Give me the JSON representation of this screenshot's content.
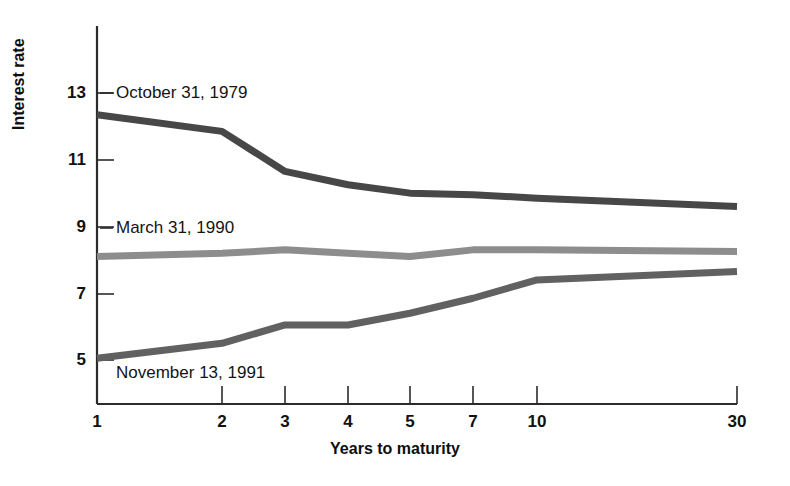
{
  "chart_data": {
    "type": "line",
    "title": "",
    "xlabel": "Years to maturity",
    "ylabel": "Interest rate",
    "x_tick_labels": [
      "1",
      "2",
      "3",
      "4",
      "5",
      "7",
      "10",
      "30"
    ],
    "categories": [
      1,
      2,
      3,
      4,
      5,
      7,
      10,
      30
    ],
    "y_tick_labels": [
      "5",
      "7",
      "9",
      "11",
      "13"
    ],
    "ylim": [
      4.2,
      13.8
    ],
    "grid": false,
    "legend_position": "inline-annotations",
    "series": [
      {
        "name": "October 31, 1979",
        "color": "#474747",
        "values": [
          12.35,
          11.85,
          10.65,
          10.25,
          10.0,
          9.95,
          9.85,
          9.6
        ]
      },
      {
        "name": "March 31, 1990",
        "color": "#8d8d8d",
        "values": [
          8.1,
          8.2,
          8.3,
          8.2,
          8.1,
          8.3,
          8.3,
          8.25
        ]
      },
      {
        "name": "November 13, 1991",
        "color": "#616161",
        "values": [
          5.05,
          5.5,
          6.05,
          6.05,
          6.4,
          6.85,
          7.4,
          7.65
        ]
      }
    ],
    "annotations": [
      {
        "text": "October 31, 1979",
        "x_px": 116,
        "y_px": 93
      },
      {
        "text": "March 31, 1990",
        "x_px": 116,
        "y_px": 228
      },
      {
        "text": "November 13, 1991",
        "x_px": 116,
        "y_px": 373
      }
    ]
  },
  "axis": {
    "y_title": "Interest rate",
    "x_title": "Years to maturity",
    "y_ticks": [
      {
        "label": "13",
        "y_px": 93
      },
      {
        "label": "11",
        "y_px": 160
      },
      {
        "label": "9",
        "y_px": 227
      },
      {
        "label": "7",
        "y_px": 294
      },
      {
        "label": "5",
        "y_px": 360
      }
    ],
    "x_ticks": [
      {
        "label": "1",
        "x_px": 97
      },
      {
        "label": "2",
        "x_px": 222
      },
      {
        "label": "3",
        "x_px": 285
      },
      {
        "label": "4",
        "x_px": 348
      },
      {
        "label": "5",
        "x_px": 410
      },
      {
        "label": "7",
        "x_px": 473
      },
      {
        "label": "10",
        "x_px": 537
      },
      {
        "label": "30",
        "x_px": 737
      }
    ]
  },
  "colors": {
    "axis": "#2b2b2b",
    "series_1979": "#474747",
    "series_1990": "#8d8d8d",
    "series_1991": "#616161",
    "background": "#ffffff"
  }
}
